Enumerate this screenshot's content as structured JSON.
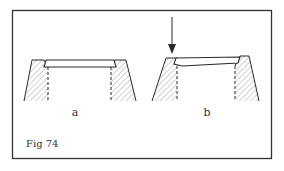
{
  "figure": {
    "caption": "Fig 74",
    "panels": [
      {
        "label": "a",
        "description": "insert seated in recess, flat"
      },
      {
        "label": "b",
        "description": "insert tilted under pressure with arrow indicating force"
      }
    ],
    "colors": {
      "line": "#2a2a2a",
      "hatch": "#8a8a8a",
      "background": "#ffffff"
    }
  }
}
